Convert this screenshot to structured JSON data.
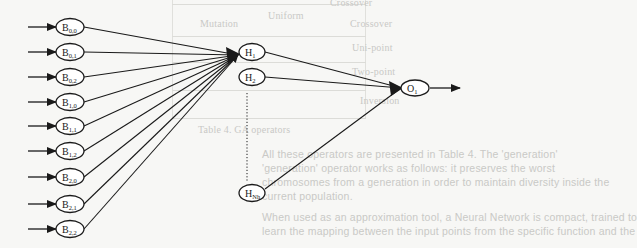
{
  "figure": {
    "type": "neural-network-diagram",
    "input_nodes": [
      {
        "id": "B00",
        "base": "B",
        "sub": "0,0",
        "y": 27
      },
      {
        "id": "B01",
        "base": "B",
        "sub": "0,1",
        "y": 52
      },
      {
        "id": "B02",
        "base": "B",
        "sub": "0,2",
        "y": 77
      },
      {
        "id": "B10",
        "base": "B",
        "sub": "1,0",
        "y": 102
      },
      {
        "id": "B11",
        "base": "B",
        "sub": "1,1",
        "y": 126
      },
      {
        "id": "B12",
        "base": "B",
        "sub": "1,2",
        "y": 151
      },
      {
        "id": "B20",
        "base": "B",
        "sub": "2,0",
        "y": 177
      },
      {
        "id": "B21",
        "base": "B",
        "sub": "2,1",
        "y": 204
      },
      {
        "id": "B22",
        "base": "B",
        "sub": "2,2",
        "y": 229
      }
    ],
    "hidden_nodes": [
      {
        "id": "H1",
        "base": "H",
        "sub": "1",
        "y": 52
      },
      {
        "id": "H2",
        "base": "H",
        "sub": "2",
        "y": 77
      },
      {
        "id": "HNh",
        "base": "H",
        "sub": "Nh",
        "y": 193
      }
    ],
    "output_nodes": [
      {
        "id": "O1",
        "base": "O",
        "sub": "1",
        "y": 88
      }
    ],
    "colors": {
      "stroke": "#1a1a1a",
      "background": "#f7f7f5",
      "bleed_text": "#c9c9c6"
    }
  },
  "bleed_through": {
    "table_headers": [
      "Mutation",
      "Crossover"
    ],
    "table_rows": [
      "Uni-point",
      "Uniform",
      "Two-point",
      "Inversion"
    ],
    "caption": "Table 4. GA operators",
    "paragraph": [
      "All these operators are presented in Table 4. The 'generation'",
      "'generation' operator works as follows: it preserves the worst",
      "chromosomes from a generation in order to maintain diversity inside the",
      "current population.",
      "When used as an approximation tool, a Neural Network is compact, trained to",
      "learn the mapping between the input points from the specific function and the"
    ]
  }
}
